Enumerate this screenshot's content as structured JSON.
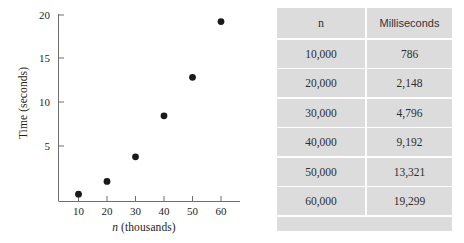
{
  "chart_data": {
    "type": "scatter",
    "title": "",
    "xlabel": "n (thousands)",
    "ylabel": "Time (seconds)",
    "x": [
      10,
      20,
      30,
      40,
      50,
      60
    ],
    "values": [
      0.786,
      2.148,
      4.796,
      9.192,
      13.321,
      19.299
    ],
    "series": [
      {
        "name": "Time (seconds)",
        "values": [
          0.786,
          2.148,
          4.796,
          9.192,
          13.321,
          19.299
        ]
      }
    ],
    "xlim": [
      5,
      65
    ],
    "ylim": [
      0,
      21
    ],
    "xticks": [
      "10",
      "20",
      "30",
      "40",
      "50",
      "60"
    ],
    "yticks": [
      "5",
      "10",
      "15",
      "20"
    ],
    "ytick_values": [
      5,
      10,
      15,
      20
    ],
    "grid": false,
    "legend": "none",
    "marker_color": "#1a1a1a",
    "axis_color": "#6e6e6e"
  },
  "table": {
    "headers": [
      "n",
      "Milliseconds"
    ],
    "rows": [
      [
        "10,000",
        "786"
      ],
      [
        "20,000",
        "2,148"
      ],
      [
        "30,000",
        "4,796"
      ],
      [
        "40,000",
        "9,192"
      ],
      [
        "50,000",
        "13,321"
      ],
      [
        "60,000",
        "19,299"
      ]
    ],
    "header_bg": "#dcdcdc",
    "cell_bg": "#dcdcdc"
  }
}
